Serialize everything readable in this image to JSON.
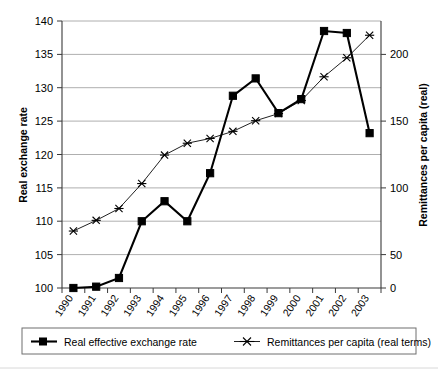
{
  "chart_data": {
    "type": "line",
    "title": "",
    "subtitle": "",
    "xlabel": "",
    "ylabel": "Real exchange rate",
    "y2label": "Remittances per capita (real)",
    "categories": [
      "1990",
      "1991",
      "1992",
      "1993",
      "1994",
      "1995",
      "1996",
      "1997",
      "1998",
      "1999",
      "2000",
      "2001",
      "2002",
      "2003"
    ],
    "x": [
      1990,
      1991,
      1992,
      1993,
      1994,
      1995,
      1996,
      1997,
      1998,
      1999,
      2000,
      2001,
      2002,
      2003
    ],
    "ylim": [
      100,
      140
    ],
    "y2lim": [
      0,
      225
    ],
    "yticks": [
      100,
      105,
      110,
      115,
      120,
      125,
      130,
      135,
      140
    ],
    "y2ticks": [
      0,
      50,
      100,
      150,
      200
    ],
    "y2tick_labels": [
      "0",
      "50",
      "100",
      "150",
      "200"
    ],
    "grid": true,
    "legend_position": "bottom",
    "series": [
      {
        "name": "Real effective exchange rate",
        "axis": "left",
        "marker": "square",
        "color": "#000000",
        "values": [
          100.0,
          100.2,
          101.5,
          110.0,
          113.0,
          110.0,
          117.2,
          128.8,
          131.4,
          126.2,
          128.3,
          138.5,
          138.2,
          123.2
        ]
      },
      {
        "name": "Remittances per capita (real terms)",
        "axis": "right",
        "marker": "star",
        "color": "#222222",
        "values": [
          48,
          57,
          67,
          88,
          112,
          122,
          126,
          132,
          141,
          147,
          158,
          178,
          194,
          213
        ]
      }
    ]
  },
  "axes": {
    "left_title": "Real exchange rate",
    "right_title": "Remittances per capita (real)",
    "y_tick_labels": [
      "140",
      "135",
      "130",
      "125",
      "120",
      "115",
      "110",
      "105",
      "100"
    ],
    "y2_tick_labels": [
      "200",
      "150",
      "100",
      "50",
      "0"
    ],
    "x_tick_labels": [
      "1990",
      "1991",
      "1992",
      "1993",
      "1994",
      "1995",
      "1996",
      "1997",
      "1998",
      "1999",
      "2000",
      "2001",
      "2002",
      "2003"
    ]
  },
  "legend": {
    "items": [
      {
        "label": "Real effective exchange rate",
        "marker": "square"
      },
      {
        "label": "Remittances per capita (real terms)",
        "marker": "star"
      }
    ]
  }
}
